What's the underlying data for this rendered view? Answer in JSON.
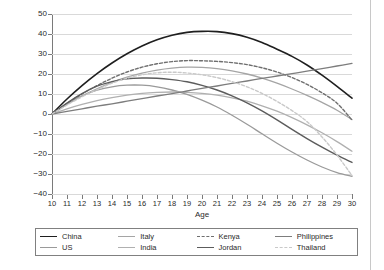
{
  "chart_data": {
    "type": "line",
    "title": "",
    "xlabel": "Age",
    "ylabel": "Sensation-Seeking Composite*100",
    "xlim": [
      10,
      30
    ],
    "ylim": [
      -40,
      50
    ],
    "grid": true,
    "legend_position": "bottom",
    "xticks": [
      10,
      11,
      12,
      13,
      14,
      15,
      16,
      17,
      18,
      19,
      20,
      21,
      22,
      23,
      24,
      25,
      26,
      27,
      28,
      29,
      30
    ],
    "yticks": [
      50,
      40,
      30,
      20,
      10,
      0,
      -10,
      -20,
      -30,
      -40
    ],
    "x": [
      10,
      11,
      12,
      13,
      14,
      15,
      16,
      17,
      18,
      19,
      20,
      21,
      22,
      23,
      24,
      25,
      26,
      27,
      28,
      29,
      30
    ],
    "series": [
      {
        "name": "China",
        "color": "#1f1f1f",
        "dash": "none",
        "width": 1.6,
        "values": [
          0,
          7.5,
          14.2,
          20.2,
          25.5,
          30.1,
          34.0,
          37.1,
          39.4,
          40.8,
          41.3,
          41.2,
          40.2,
          38.4,
          35.8,
          32.4,
          28.8,
          24.5,
          19.4,
          13.8,
          7.9
        ]
      },
      {
        "name": "US",
        "color": "#9a9a9a",
        "dash": "none",
        "width": 1.3,
        "values": [
          0,
          5.0,
          9.0,
          11.9,
          13.6,
          14.4,
          14.4,
          13.6,
          12.0,
          9.8,
          6.9,
          3.5,
          -0.6,
          -5.1,
          -9.9,
          -14.6,
          -19.0,
          -23.0,
          -26.5,
          -29.3,
          -31.2
        ]
      },
      {
        "name": "Italy",
        "color": "#a5a5a5",
        "dash": "none",
        "width": 1.3,
        "values": [
          0,
          4.8,
          9.0,
          12.6,
          15.8,
          18.4,
          20.4,
          21.9,
          22.9,
          23.4,
          23.3,
          22.7,
          21.6,
          20.0,
          17.9,
          15.4,
          12.5,
          9.3,
          5.8,
          1.9,
          -2.8
        ]
      },
      {
        "name": "India",
        "color": "#b0b0b0",
        "dash": "none",
        "width": 1.3,
        "values": [
          0,
          2.6,
          4.8,
          6.7,
          8.2,
          9.4,
          10.3,
          10.8,
          11.0,
          10.8,
          10.3,
          9.4,
          8.1,
          6.4,
          4.1,
          1.4,
          -1.8,
          -5.4,
          -9.4,
          -13.8,
          -18.6
        ]
      },
      {
        "name": "Kenya",
        "color": "#6e6e6e",
        "dash": "dashed",
        "width": 1.4,
        "values": [
          0,
          5.3,
          10.0,
          14.2,
          17.9,
          21.0,
          23.4,
          25.1,
          26.2,
          26.7,
          26.6,
          26.3,
          25.7,
          24.7,
          23.1,
          21.0,
          18.2,
          14.8,
          10.6,
          5.4,
          -3.0
        ]
      },
      {
        "name": "Jordan",
        "color": "#5c5c5c",
        "dash": "none",
        "width": 1.4,
        "values": [
          0,
          5.5,
          10.2,
          13.9,
          16.2,
          17.6,
          18.0,
          17.9,
          17.2,
          16.1,
          14.3,
          12.0,
          9.1,
          5.6,
          1.6,
          -2.9,
          -7.7,
          -12.3,
          -16.6,
          -20.6,
          -24.2
        ]
      },
      {
        "name": "Philippines",
        "color": "#7d7d7d",
        "dash": "none",
        "width": 1.3,
        "values": [
          0,
          1.3,
          2.6,
          3.9,
          5.1,
          6.4,
          7.7,
          9.0,
          10.2,
          11.5,
          12.8,
          14.0,
          15.3,
          16.5,
          17.8,
          19.0,
          20.2,
          21.4,
          22.7,
          24.0,
          25.3
        ]
      },
      {
        "name": "Thailand",
        "color": "#c9c9c9",
        "dash": "dashed",
        "width": 1.4,
        "values": [
          0,
          4.5,
          8.6,
          12.2,
          15.4,
          17.9,
          19.6,
          20.6,
          20.9,
          20.5,
          19.6,
          18.2,
          16.2,
          13.6,
          10.3,
          6.3,
          1.7,
          -3.8,
          -11.5,
          -20.5,
          -30.8
        ]
      }
    ]
  },
  "axis": {
    "xlabel": "Age",
    "ylabel": "Sensation-Seeking Composite*100"
  }
}
